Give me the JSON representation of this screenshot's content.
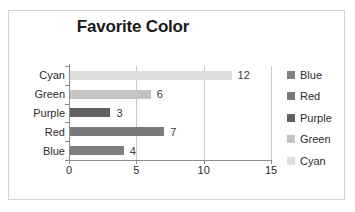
{
  "chart_data": {
    "type": "bar",
    "orientation": "horizontal",
    "title": "Favorite Color",
    "xlabel": "",
    "ylabel": "",
    "categories": [
      "Blue",
      "Red",
      "Purple",
      "Green",
      "Cyan"
    ],
    "values": [
      4,
      7,
      3,
      6,
      12
    ],
    "data_labels": [
      "4",
      "7",
      "3",
      "6",
      "12"
    ],
    "xlim": [
      0,
      15
    ],
    "xticks": [
      0,
      5,
      10,
      15
    ],
    "xtick_labels": [
      "0",
      "5",
      "10",
      "15"
    ],
    "grid": true,
    "grid_axis": "x",
    "legend_position": "right",
    "legend": [
      {
        "label": "Blue",
        "color": "#808080"
      },
      {
        "label": "Red",
        "color": "#7a7a7a"
      },
      {
        "label": "Purple",
        "color": "#616161"
      },
      {
        "label": "Green",
        "color": "#c4c4c4"
      },
      {
        "label": "Cyan",
        "color": "#dcdcdc"
      }
    ],
    "bars": [
      {
        "category": "Cyan",
        "value": 12,
        "label": "12",
        "color": "#dcdcdc"
      },
      {
        "category": "Green",
        "value": 6,
        "label": "6",
        "color": "#c4c4c4"
      },
      {
        "category": "Purple",
        "value": 3,
        "label": "3",
        "color": "#616161"
      },
      {
        "category": "Red",
        "value": 7,
        "label": "7",
        "color": "#7a7a7a"
      },
      {
        "category": "Blue",
        "value": 4,
        "label": "4",
        "color": "#808080"
      }
    ],
    "axis_labels_top_to_bottom": [
      "Cyan",
      "Green",
      "Purple",
      "Red",
      "Blue"
    ]
  },
  "colors": {
    "border": "#d4d4d4",
    "axis": "#8c8c8c",
    "gridline": "#c9c9c9",
    "text": "#2b2b2b",
    "title": "#1a1a1a"
  }
}
